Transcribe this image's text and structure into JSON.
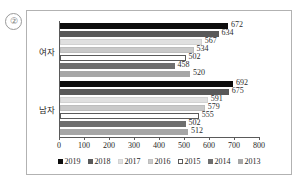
{
  "item_number": "②",
  "chart_data": {
    "type": "bar",
    "orientation": "horizontal",
    "title": "",
    "xlabel": "",
    "ylabel": "",
    "categories": [
      "여자",
      "남자"
    ],
    "xlim": [
      0,
      800
    ],
    "xticks": [
      0,
      100,
      200,
      300,
      400,
      500,
      600,
      700,
      800
    ],
    "xtick_labels": [
      "0",
      "100",
      "200",
      "300",
      "400",
      "500",
      "600",
      "700",
      "800"
    ],
    "grid": false,
    "legend_position": "bottom",
    "series": [
      {
        "name": "2019",
        "color": "#0d0d0d",
        "border": "#0d0d0d",
        "values": [
          672,
          692
        ]
      },
      {
        "name": "2018",
        "color": "#595959",
        "border": "#595959",
        "values": [
          634,
          675
        ]
      },
      {
        "name": "2017",
        "color": "#e0e0e0",
        "border": "#d2d2d2",
        "values": [
          567,
          591
        ]
      },
      {
        "name": "2016",
        "color": "#c9c9c9",
        "border": "#bdbdbd",
        "values": [
          534,
          579
        ]
      },
      {
        "name": "2015",
        "color": "#ffffff",
        "border": "#5a5a5a",
        "values": [
          502,
          555
        ]
      },
      {
        "name": "2014",
        "color": "#6e6e6e",
        "border": "#6e6e6e",
        "values": [
          458,
          502
        ]
      },
      {
        "name": "2013",
        "color": "#a6a6a6",
        "border": "#a6a6a6",
        "values": [
          520,
          512
        ]
      }
    ],
    "data_labels": {
      "여자": [
        "672",
        "634",
        "567",
        "534",
        "502",
        "458",
        "520"
      ],
      "남자": [
        "692",
        "675",
        "591",
        "579",
        "555",
        "502",
        "512"
      ]
    }
  },
  "legend": {
    "items": [
      {
        "label": "2019"
      },
      {
        "label": "2018"
      },
      {
        "label": "2017"
      },
      {
        "label": "2016"
      },
      {
        "label": "2015"
      },
      {
        "label": "2014"
      },
      {
        "label": "2013"
      }
    ]
  }
}
